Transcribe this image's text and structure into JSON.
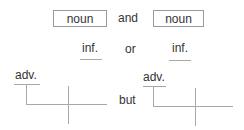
{
  "row1": {
    "left_box": "noun",
    "conjunction": "and",
    "right_box": "noun"
  },
  "row2": {
    "left_slot": "inf.",
    "conjunction": "or",
    "right_slot": "inf."
  },
  "row3": {
    "left_modifier": "adv.",
    "conjunction": "but",
    "right_modifier": "adv."
  }
}
